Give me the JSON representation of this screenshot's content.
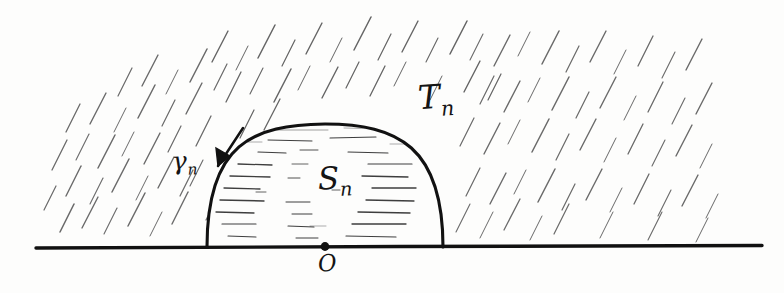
{
  "figure": {
    "kind": "hand-drawn-math-diagram",
    "background_color": "#fdfdfc",
    "ink_color": "#141414",
    "hatch_color": "#4a4a4a",
    "labels": {
      "exterior_region": {
        "base": "T",
        "sub": "n",
        "full": "T_n"
      },
      "boundary_curve": {
        "base": "γ",
        "sub": "n",
        "full": "γ_n"
      },
      "interior_region": {
        "base": "S",
        "sub": "n",
        "full": "S_n"
      },
      "origin": {
        "base": "O",
        "sub": "",
        "full": "O"
      }
    },
    "geometry": {
      "baseline": {
        "x_start": 36,
        "x_end": 762,
        "y": 247
      },
      "origin_point": {
        "x": 325,
        "y": 247
      },
      "arc": {
        "left_foot_x": 207,
        "right_foot_x": 443,
        "apex_x": 325,
        "apex_y": 125,
        "base_y": 247
      },
      "arrow": {
        "tail_x": 236,
        "tail_y": 131,
        "head_x": 217,
        "head_y": 165
      }
    },
    "hatching": {
      "region": "exterior",
      "style": "short diagonal strokes, lower-left to upper-right",
      "angle_degrees": 62
    },
    "interior_shading": {
      "region": "interior",
      "style": "short horizontal dashes"
    }
  }
}
